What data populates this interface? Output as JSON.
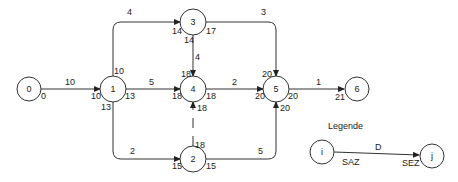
{
  "diagram": {
    "type": "network-plan",
    "nodes": [
      {
        "id": "0",
        "label": "0",
        "x": 29,
        "y": 89
      },
      {
        "id": "1",
        "label": "1",
        "x": 113,
        "y": 89
      },
      {
        "id": "3",
        "label": "3",
        "x": 193,
        "y": 22
      },
      {
        "id": "4",
        "label": "4",
        "x": 193,
        "y": 89
      },
      {
        "id": "2",
        "label": "2",
        "x": 193,
        "y": 159
      },
      {
        "id": "5",
        "label": "5",
        "x": 276,
        "y": 89
      },
      {
        "id": "6",
        "label": "6",
        "x": 357,
        "y": 89
      }
    ],
    "edges": [
      {
        "from": "0",
        "to": "1",
        "duration": "10"
      },
      {
        "from": "1",
        "to": "3",
        "duration": "4"
      },
      {
        "from": "1",
        "to": "4",
        "duration": "5"
      },
      {
        "from": "1",
        "to": "2",
        "duration": "2"
      },
      {
        "from": "3",
        "to": "4",
        "duration": "4"
      },
      {
        "from": "3",
        "to": "5",
        "duration": "3"
      },
      {
        "from": "4",
        "to": "5",
        "duration": "2"
      },
      {
        "from": "2",
        "to": "4",
        "duration": "",
        "dummy": true
      },
      {
        "from": "2",
        "to": "5",
        "duration": "5"
      },
      {
        "from": "5",
        "to": "6",
        "duration": "1"
      }
    ],
    "times": [
      {
        "text": "0",
        "x": 41,
        "y": 97
      },
      {
        "text": "10",
        "x": 91,
        "y": 97
      },
      {
        "text": "10",
        "x": 114,
        "y": 72
      },
      {
        "text": "13",
        "x": 125,
        "y": 97
      },
      {
        "text": "13",
        "x": 101,
        "y": 108
      },
      {
        "text": "14",
        "x": 172,
        "y": 26
      },
      {
        "text": "17",
        "x": 206,
        "y": 26
      },
      {
        "text": "14",
        "x": 184,
        "y": 36
      },
      {
        "text": "18",
        "x": 181,
        "y": 72
      },
      {
        "text": "18",
        "x": 172,
        "y": 97
      },
      {
        "text": "18",
        "x": 206,
        "y": 97
      },
      {
        "text": "18",
        "x": 197,
        "y": 107
      },
      {
        "text": "18",
        "x": 194,
        "y": 141
      },
      {
        "text": "15",
        "x": 172,
        "y": 165
      },
      {
        "text": "15",
        "x": 206,
        "y": 165
      },
      {
        "text": "20",
        "x": 263,
        "y": 72
      },
      {
        "text": "20",
        "x": 255,
        "y": 97
      },
      {
        "text": "20",
        "x": 288,
        "y": 97
      },
      {
        "text": "20",
        "x": 280,
        "y": 107
      },
      {
        "text": "21",
        "x": 335,
        "y": 97
      }
    ],
    "durations": [
      {
        "text": "10",
        "x": 65,
        "y": 85
      },
      {
        "text": "4",
        "x": 127,
        "y": 15
      },
      {
        "text": "5",
        "x": 149,
        "y": 85
      },
      {
        "text": "2",
        "x": 130,
        "y": 154
      },
      {
        "text": "4",
        "x": 195,
        "y": 60
      },
      {
        "text": "3",
        "x": 261,
        "y": 15
      },
      {
        "text": "2",
        "x": 232,
        "y": 85
      },
      {
        "text": "5",
        "x": 258,
        "y": 154
      },
      {
        "text": "1",
        "x": 316,
        "y": 85
      }
    ],
    "legend": {
      "title": "Legende",
      "node_i": "i",
      "node_j": "j",
      "duration": "D",
      "start_label": "SAZ",
      "end_label": "SEZ"
    }
  }
}
